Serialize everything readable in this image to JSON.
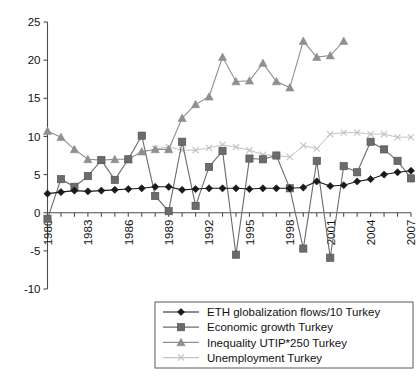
{
  "chart_data": {
    "type": "line",
    "title": "",
    "xlabel": "",
    "ylabel": "",
    "xlim": [
      1980,
      2007
    ],
    "ylim": [
      -10,
      25
    ],
    "ytick_values": [
      -10,
      -5,
      0,
      5,
      10,
      15,
      20,
      25
    ],
    "ytick_labels": [
      "-10",
      "-5",
      "0",
      "5",
      "10",
      "15",
      "20",
      "25"
    ],
    "xtick_values": [
      1980,
      1983,
      1986,
      1989,
      1992,
      1995,
      1998,
      2001,
      2004,
      2007
    ],
    "xtick_labels": [
      "1980",
      "1983",
      "1986",
      "1989",
      "1992",
      "1995",
      "1998",
      "2001",
      "2004",
      "2007"
    ],
    "x": [
      1980,
      1981,
      1982,
      1983,
      1984,
      1985,
      1986,
      1987,
      1988,
      1989,
      1990,
      1991,
      1992,
      1993,
      1994,
      1995,
      1996,
      1997,
      1998,
      1999,
      2000,
      2001,
      2002,
      2003,
      2004,
      2005,
      2006,
      2007
    ],
    "grid": false,
    "legend_position": "bottom-right",
    "series": [
      {
        "name": "ETH globalization flows/10 Turkey",
        "marker": "diamond",
        "color": "#1a1a1a",
        "values": [
          2.5,
          2.7,
          2.9,
          2.8,
          2.9,
          3.0,
          3.1,
          3.2,
          3.4,
          3.4,
          3.0,
          3.1,
          3.2,
          3.2,
          3.2,
          3.1,
          3.2,
          3.2,
          3.2,
          3.3,
          4.1,
          3.5,
          3.6,
          4.1,
          4.4,
          5.0,
          5.3,
          5.5
        ]
      },
      {
        "name": "Economic growth Turkey",
        "marker": "square",
        "color": "#6b6b6b",
        "values": [
          -0.8,
          4.4,
          3.4,
          4.8,
          6.9,
          4.3,
          7.0,
          10.1,
          2.2,
          0.2,
          9.3,
          0.9,
          6.0,
          8.1,
          -5.5,
          7.1,
          7.0,
          7.5,
          3.2,
          -4.7,
          6.8,
          -5.9,
          6.1,
          5.3,
          9.3,
          8.3,
          6.8,
          4.5
        ]
      },
      {
        "name": "Inequality UTIP*250 Turkey",
        "marker": "triangle",
        "color": "#8f8f8f",
        "values": [
          10.7,
          9.9,
          8.3,
          7.0,
          6.9,
          7.0,
          7.0,
          8.0,
          8.3,
          8.3,
          12.4,
          14.2,
          15.2,
          20.4,
          17.2,
          17.3,
          19.6,
          17.2,
          16.4,
          22.5,
          20.4,
          20.6,
          22.5,
          null,
          null,
          null,
          null,
          null
        ]
      },
      {
        "name": "Unemployment Turkey",
        "marker": "x",
        "color": "#c2c2c2",
        "values": [
          null,
          null,
          null,
          null,
          null,
          null,
          null,
          null,
          8.4,
          8.6,
          8.2,
          8.2,
          8.5,
          8.9,
          8.6,
          8.2,
          7.6,
          7.5,
          7.3,
          8.8,
          8.4,
          10.3,
          10.5,
          10.5,
          10.3,
          10.3,
          9.9,
          9.9
        ]
      }
    ],
    "legend": [
      {
        "label": "ETH globalization flows/10 Turkey",
        "marker": "diamond",
        "color": "#1a1a1a"
      },
      {
        "label": "Economic growth Turkey",
        "marker": "square",
        "color": "#6b6b6b"
      },
      {
        "label": "Inequality UTIP*250 Turkey",
        "marker": "triangle",
        "color": "#8f8f8f"
      },
      {
        "label": "Unemployment Turkey",
        "marker": "x",
        "color": "#c2c2c2"
      }
    ]
  }
}
